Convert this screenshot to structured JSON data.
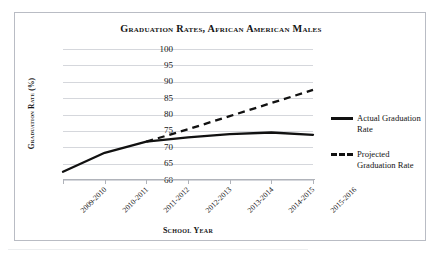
{
  "chart_data": {
    "type": "line",
    "title": "Graduation Rates, African American Males",
    "xlabel": "School Year",
    "ylabel": "Graduation Rate (%)",
    "categories": [
      "2009-2010",
      "2010-2011",
      "2011-2012",
      "2012-2013",
      "2013-2014",
      "2014-2015",
      "2015-2016"
    ],
    "ylim": [
      60,
      100
    ],
    "yticks": [
      60,
      65,
      70,
      75,
      80,
      85,
      90,
      95,
      100
    ],
    "grid": true,
    "legend_position": "right",
    "series": [
      {
        "name": "Actual Graduation Rate",
        "style": "solid",
        "color": "#111111",
        "values": [
          62.5,
          68.3,
          71.7,
          73.0,
          74.0,
          74.5,
          73.8
        ]
      },
      {
        "name": "Projected Graduation Rate",
        "style": "dashed",
        "color": "#111111",
        "values": [
          null,
          null,
          71.7,
          75.5,
          79.5,
          83.5,
          87.5
        ]
      }
    ]
  },
  "legend": {
    "entries": [
      {
        "label": "Actual Graduation Rate",
        "style": "solid"
      },
      {
        "label": "Projected Graduation Rate",
        "style": "dashed"
      }
    ]
  }
}
